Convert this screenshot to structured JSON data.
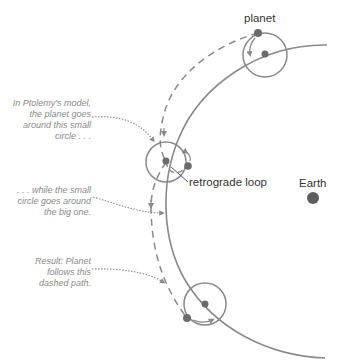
{
  "labels": {
    "planet": "planet",
    "retrograde": "retrograde loop",
    "earth": "Earth"
  },
  "notes": [
    {
      "lines": [
        "In Ptolemy's model,",
        "the planet goes",
        "around this small",
        "circle . . ."
      ]
    },
    {
      "lines": [
        ". . . while the small",
        "circle goes around",
        "the big one."
      ]
    },
    {
      "lines": [
        "Result: Planet",
        "follows this",
        "dashed path."
      ]
    }
  ],
  "colors": {
    "stroke": "#8a8a8a",
    "dot": "#6b6b6b",
    "earth": "#5e5e5e",
    "note_text": "#8a8a8a",
    "label_text": "#333333"
  }
}
